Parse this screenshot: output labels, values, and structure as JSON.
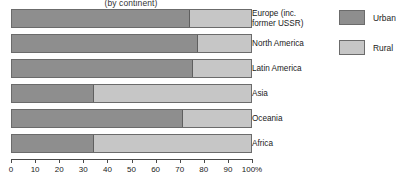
{
  "chart_data": {
    "type": "bar",
    "orientation": "horizontal",
    "stacked": true,
    "title": "(by continent)",
    "xlabel": "",
    "ylabel": "",
    "xlim": [
      0,
      100
    ],
    "xticks": [
      0,
      10,
      20,
      30,
      40,
      50,
      60,
      70,
      80,
      90,
      100
    ],
    "xtick_labels": [
      "0",
      "10",
      "20",
      "30",
      "40",
      "50",
      "60",
      "70",
      "80",
      "90",
      "100%"
    ],
    "grid": false,
    "legend_position": "right",
    "categories": [
      "Europe (inc.\nformer USSR)",
      "North America",
      "Latin America",
      "Asia",
      "Oceania",
      "Africa"
    ],
    "series": [
      {
        "name": "Urban",
        "color": "#8e8e8e",
        "values": [
          74,
          77,
          75,
          34,
          71,
          34
        ]
      },
      {
        "name": "Rural",
        "color": "#c6c6c6",
        "values": [
          26,
          23,
          25,
          66,
          29,
          66
        ]
      }
    ]
  },
  "legend": {
    "items": [
      {
        "label": "Urban",
        "color": "#8e8e8e"
      },
      {
        "label": "Rural",
        "color": "#c6c6c6"
      }
    ]
  }
}
